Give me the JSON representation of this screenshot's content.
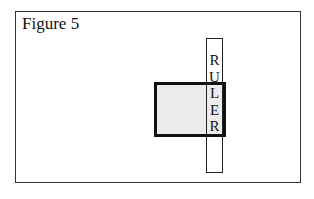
{
  "figure": {
    "title": "Figure 5",
    "ruler": {
      "label_letters": [
        "R",
        "U",
        "L",
        "E",
        "R"
      ]
    },
    "colors": {
      "square_fill": "#ececec",
      "stroke": "#111111",
      "background": "#ffffff"
    }
  }
}
